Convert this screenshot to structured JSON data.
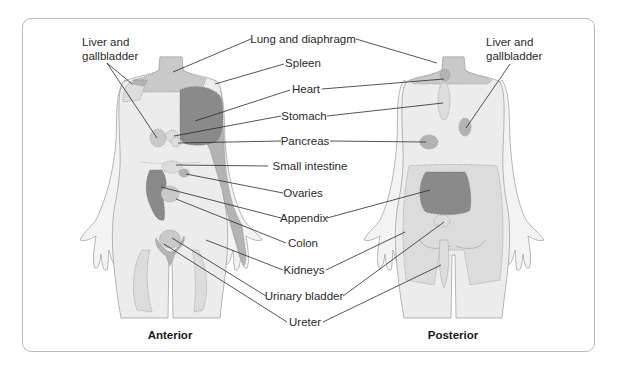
{
  "figure": {
    "views": {
      "anterior": {
        "caption": "Anterior"
      },
      "posterior": {
        "caption": "Posterior"
      }
    },
    "center_labels": [
      "Lung and diaphragm",
      "Spleen",
      "Heart",
      "Stomach",
      "Pancreas",
      "Small intestine",
      "Ovaries",
      "Appendix",
      "Colon",
      "Kidneys",
      "Urinary bladder",
      "Ureter"
    ],
    "side_labels": {
      "anterior_liver": {
        "line1": "Liver and",
        "line2": "gallbladder"
      },
      "posterior_liver": {
        "line1": "Liver and",
        "line2": "gallbladder"
      }
    },
    "colors": {
      "skin": "#ececec",
      "limb": "#f3f3f3",
      "zone_light": "#dcdcdc",
      "zone_mid": "#c9c9c9",
      "zone_medium": "#b3b3b3",
      "zone_dark": "#8a8a8a",
      "leader_line": "#2a2a2a",
      "frame_border": "#b9b9b9"
    }
  }
}
